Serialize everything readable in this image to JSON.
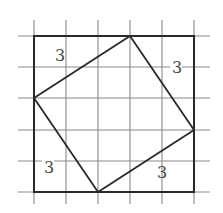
{
  "diagram": {
    "type": "grid-square-inscribed",
    "grid": {
      "vertical_x": [
        34,
        66,
        98,
        130,
        162,
        194
      ],
      "horizontal_y": [
        36,
        67,
        98,
        130,
        161,
        192
      ],
      "extent": {
        "x1": 18,
        "x2": 210,
        "y1": 20,
        "y2": 204
      },
      "color": "#8a8a8a"
    },
    "outer_square": {
      "x": 34,
      "y": 36,
      "width": 160,
      "height": 156,
      "color": "#2a2a2a"
    },
    "inner_square": {
      "points": "130,36 194,130 98,192 34,98",
      "color": "#2a2a2a"
    },
    "labels": [
      {
        "text": "3",
        "x": 55,
        "y": 61
      },
      {
        "text": "3",
        "x": 172,
        "y": 73
      },
      {
        "text": "3",
        "x": 44,
        "y": 173
      },
      {
        "text": "3",
        "x": 157,
        "y": 178
      }
    ]
  }
}
